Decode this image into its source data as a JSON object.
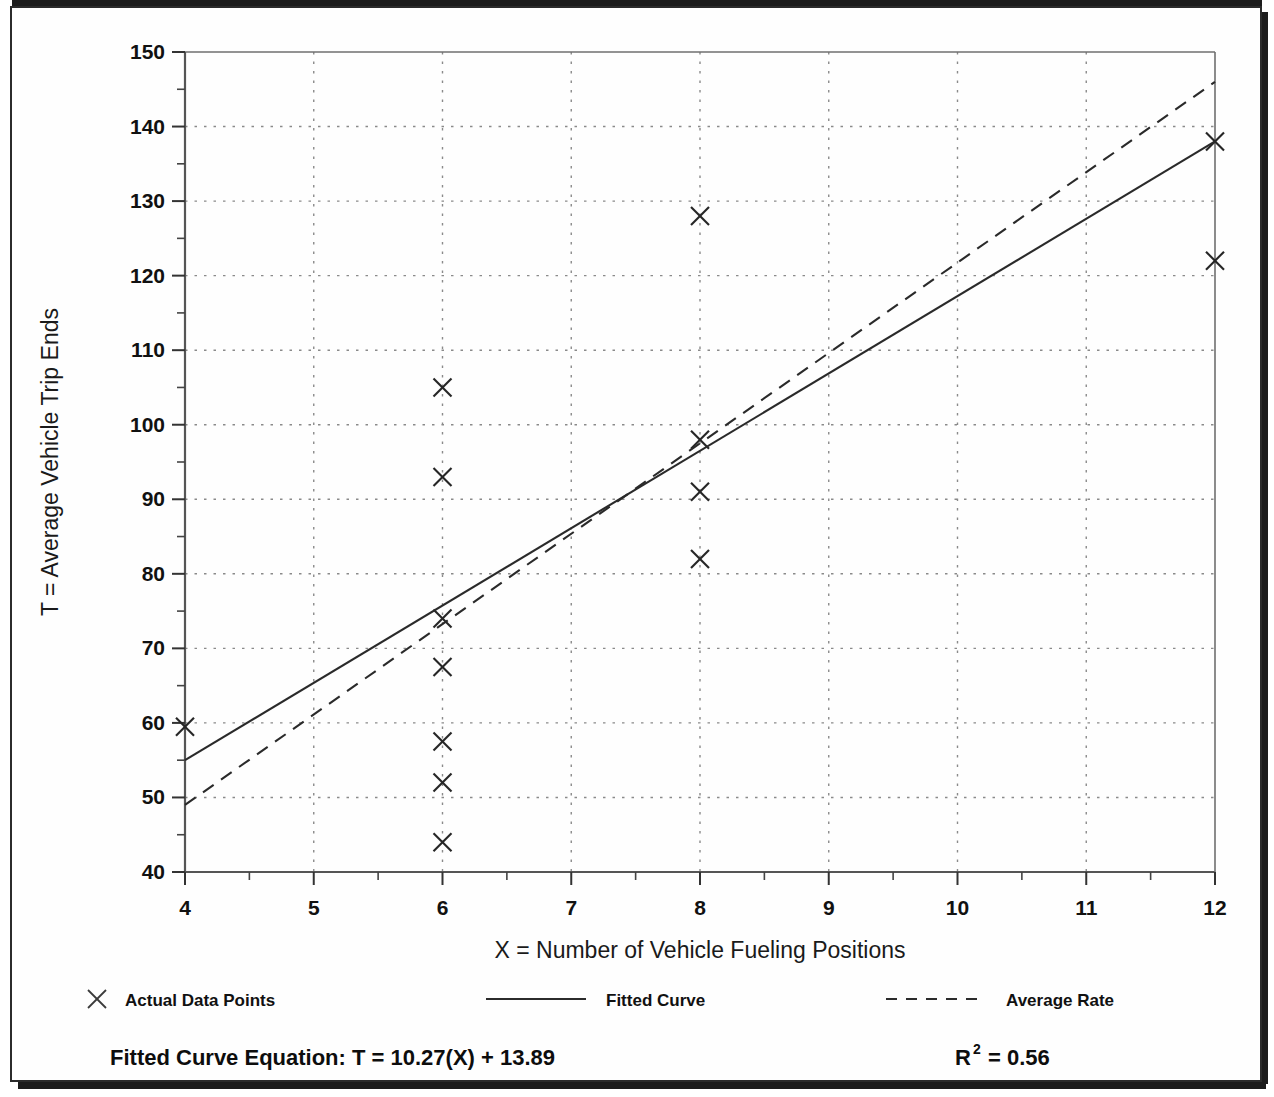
{
  "chart_data": {
    "type": "scatter",
    "title": "",
    "xlabel": "X = Number of Vehicle Fueling Positions",
    "ylabel": "T = Average Vehicle Trip Ends",
    "xlim": [
      4,
      12
    ],
    "ylim": [
      40,
      150
    ],
    "xticks": [
      4,
      5,
      6,
      7,
      8,
      9,
      10,
      11,
      12
    ],
    "yticks": [
      40,
      50,
      60,
      70,
      80,
      90,
      100,
      110,
      120,
      130,
      140,
      150
    ],
    "xtick_labels": [
      "4",
      "5",
      "6",
      "7",
      "8",
      "9",
      "10",
      "11",
      "12"
    ],
    "ytick_labels": [
      "40",
      "50",
      "60",
      "70",
      "80",
      "90",
      "100",
      "110",
      "120",
      "130",
      "140",
      "150"
    ],
    "y_minor_ticks": [
      45,
      55,
      65,
      75,
      85,
      95,
      105,
      115,
      125,
      135,
      145
    ],
    "grid": true,
    "grid_style": "dotted",
    "legend_position": "below-axes",
    "series": [
      {
        "name": "Actual Data Points",
        "type": "scatter",
        "marker": "x",
        "points": [
          {
            "x": 4,
            "y": 59.5
          },
          {
            "x": 6,
            "y": 105
          },
          {
            "x": 6,
            "y": 93
          },
          {
            "x": 6,
            "y": 74
          },
          {
            "x": 6,
            "y": 67.5
          },
          {
            "x": 6,
            "y": 57.5
          },
          {
            "x": 6,
            "y": 52
          },
          {
            "x": 6,
            "y": 44
          },
          {
            "x": 8,
            "y": 128
          },
          {
            "x": 8,
            "y": 98
          },
          {
            "x": 8,
            "y": 91
          },
          {
            "x": 8,
            "y": 82
          },
          {
            "x": 12,
            "y": 138
          },
          {
            "x": 12,
            "y": 122
          }
        ]
      },
      {
        "name": "Fitted Curve",
        "type": "line",
        "style": "solid",
        "endpoints": [
          {
            "x": 4,
            "y": 55
          },
          {
            "x": 12,
            "y": 138
          }
        ]
      },
      {
        "name": "Average Rate",
        "type": "line",
        "style": "dashed",
        "endpoints": [
          {
            "x": 4,
            "y": 49
          },
          {
            "x": 12,
            "y": 146
          }
        ]
      }
    ]
  },
  "legend": {
    "items": [
      {
        "label": "Actual Data Points",
        "marker": "x-marker"
      },
      {
        "label": "Fitted Curve",
        "marker": "solid-line"
      },
      {
        "label": "Average Rate",
        "marker": "dashed-line"
      }
    ]
  },
  "footer": {
    "equation_label": "Fitted Curve Equation:",
    "equation_value": "T = 10.27(X) + 13.89",
    "r_squared_base": "R",
    "r_squared_exponent": "2",
    "r_squared_value": "= 0.56"
  },
  "colors": {
    "ink": "#1a1a1a",
    "grid": "#8a8a8a",
    "frame": "#2b2b2b",
    "paper": "#ffffff"
  }
}
